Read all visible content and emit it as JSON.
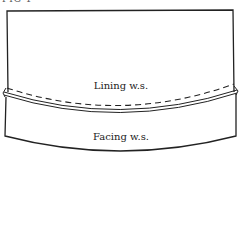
{
  "figure": {
    "label": "FIG 1",
    "pieces": [
      {
        "name": "lining",
        "label": "Lining w.s."
      },
      {
        "name": "facing",
        "label": "Facing w.s."
      }
    ],
    "stroke_color": "#222222",
    "line_styles": {
      "stitching": "dashed",
      "seam": "double"
    }
  }
}
